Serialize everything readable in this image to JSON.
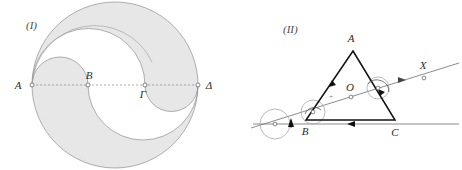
{
  "figure": {
    "background_color": "#ffffff",
    "shade_color": "#e7e7e7",
    "outline_color": "#8d8d8d",
    "ink_color": "#111111",
    "width": 462,
    "height": 170
  },
  "panels": [
    {
      "tag": "(I)",
      "name": "arbelos-yin-yang-diagram",
      "description": "Large circle with diameter AΔ divided at B and Γ into semicircular lobes forming a yin-yang style shaded region",
      "points": [
        {
          "label": "A",
          "x": 32,
          "y": 85
        },
        {
          "label": "B",
          "x": 88,
          "y": 85
        },
        {
          "label": "Γ",
          "x": 145,
          "y": 85
        },
        {
          "label": "Δ",
          "x": 198,
          "y": 85
        }
      ],
      "diameter_label": "AΔ",
      "diameter_style": "dashed"
    },
    {
      "tag": "(II)",
      "name": "triangle-rotation-diagram",
      "description": "Triangle ABC with interior point O, a transversal line through O toward point X, and rotation arc markers on the base line",
      "points": [
        {
          "label": "A",
          "x": 122,
          "y": 51
        },
        {
          "label": "B",
          "x": 75,
          "y": 120
        },
        {
          "label": "C",
          "x": 164,
          "y": 120
        },
        {
          "label": "O",
          "x": 120,
          "y": 97
        },
        {
          "label": "X",
          "x": 193,
          "y": 78
        }
      ],
      "edges": [
        "AB",
        "BC",
        "CA"
      ],
      "marks": {
        "plus": "+"
      }
    }
  ]
}
